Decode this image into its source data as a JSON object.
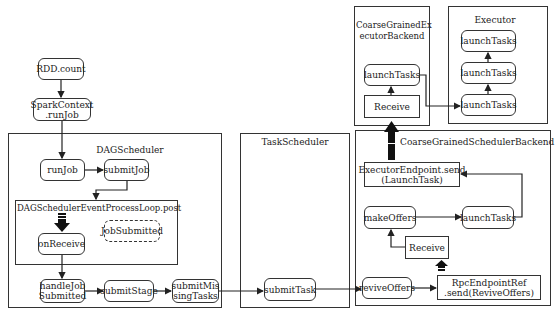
{
  "diagram": {
    "type": "flowchart",
    "nodes": {
      "rdd_count": "RDD.count",
      "spark_context": "SparkContext\n.runJob",
      "run_job": "runJob",
      "submit_job": "submitJob",
      "on_receive": "onReceive",
      "job_submitted": "JobSubmitted",
      "handle_job_submitted": "handleJob\nSubmitted",
      "submit_stage": "submitStage",
      "submit_missing_tasks": "submitMis\nsingTasks",
      "submit_task": "submitTask",
      "revive_offers": "reviveOffers",
      "rpc_endpoint_ref": "RpcEndpointRef\n.send(ReviveOffers)",
      "receive_scheduler": "Receive",
      "make_offers": "makeOffers",
      "launch_tasks_scheduler": "launchTasks",
      "executor_endpoint_send": "ExecutorEndpoint.send\n(LaunchTask)",
      "receive_executor_backend": "Receive",
      "launch_tasks_backend": "launchTasks",
      "executor_launch_1": "launchTasks",
      "executor_launch_2": "launchTasks",
      "executor_launch_3": "launchTasks"
    },
    "groups": {
      "dag_scheduler": "DAGScheduler",
      "event_loop": "DAGSchedulerEventProcessLoop.post",
      "task_scheduler": "TaskScheduler",
      "scheduler_backend": "CoarseGrainedSchedulerBackend",
      "executor_backend": "CoarseGrainedEx\necutorBackend",
      "executor": "Executor"
    },
    "edges": [
      [
        "RDD.count",
        "SparkContext.runJob"
      ],
      [
        "SparkContext.runJob",
        "runJob"
      ],
      [
        "runJob",
        "submitJob"
      ],
      [
        "submitJob",
        "DAGSchedulerEventProcessLoop.post"
      ],
      [
        "DAGSchedulerEventProcessLoop.post",
        "onReceive"
      ],
      [
        "onReceive",
        "handleJobSubmitted"
      ],
      [
        "handleJobSubmitted",
        "submitStage"
      ],
      [
        "submitStage",
        "submitMissingTasks"
      ],
      [
        "submitMissingTasks",
        "submitTask"
      ],
      [
        "submitTask",
        "reviveOffers"
      ],
      [
        "reviveOffers",
        "RpcEndpointRef.send(ReviveOffers)"
      ],
      [
        "RpcEndpointRef.send(ReviveOffers)",
        "Receive"
      ],
      [
        "Receive",
        "makeOffers"
      ],
      [
        "makeOffers",
        "launchTasks"
      ],
      [
        "launchTasks",
        "ExecutorEndpoint.send(LaunchTask)"
      ],
      [
        "ExecutorEndpoint.send(LaunchTask)",
        "Receive (ExecutorBackend)"
      ],
      [
        "Receive (ExecutorBackend)",
        "launchTasks (ExecutorBackend)"
      ],
      [
        "launchTasks (ExecutorBackend)",
        "launchTasks (Executor 1)"
      ],
      [
        "launchTasks (Executor 1)",
        "launchTasks (Executor 2)"
      ],
      [
        "launchTasks (Executor 2)",
        "launchTasks (Executor 3)"
      ]
    ]
  }
}
